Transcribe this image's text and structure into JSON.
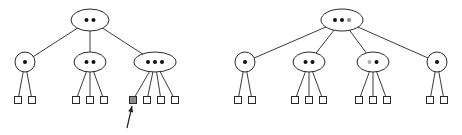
{
  "diagram": {
    "type": "2-3-4 tree insertion (before / after split)",
    "colors": {
      "stroke": "#2a2a2a",
      "key": "#111111",
      "highlight_key": "#8a8a8a",
      "promoted_key_light": "#b0b0b0",
      "shaded_leaf": "#8a8a8a"
    },
    "trees": [
      {
        "name": "before",
        "root": {
          "cx": 90,
          "cy": 20,
          "rx": 19,
          "ry": 11,
          "keys": 2
        },
        "children": [
          {
            "cx": 25,
            "cy": 62,
            "rx": 10,
            "ry": 10,
            "keys": 1,
            "leaves": [
              18,
              32
            ]
          },
          {
            "cx": 90,
            "cy": 62,
            "rx": 16,
            "ry": 10,
            "keys": 2,
            "leaves": [
              76,
              90,
              104
            ]
          },
          {
            "cx": 155,
            "cy": 62,
            "rx": 21,
            "ry": 10,
            "keys": 3,
            "leaves": [
              133,
              147,
              161,
              175
            ],
            "shaded_leaf_index": 0
          }
        ],
        "leaf_y": 100,
        "arrow": {
          "from": [
            127,
            128
          ],
          "to": [
            132,
            106
          ],
          "label": "insertion point"
        }
      },
      {
        "name": "after",
        "root": {
          "cx": 342,
          "cy": 20,
          "rx": 21,
          "ry": 11,
          "keys": 3,
          "highlight_key_index": 2
        },
        "children": [
          {
            "cx": 245,
            "cy": 62,
            "rx": 10,
            "ry": 10,
            "keys": 1,
            "leaves": [
              238,
              252
            ]
          },
          {
            "cx": 309,
            "cy": 62,
            "rx": 16,
            "ry": 10,
            "keys": 2,
            "leaves": [
              295,
              309,
              323
            ]
          },
          {
            "cx": 373,
            "cy": 62,
            "rx": 16,
            "ry": 10,
            "keys": 2,
            "light_key_index": 0,
            "leaves": [
              359,
              373,
              387
            ]
          },
          {
            "cx": 437,
            "cy": 62,
            "rx": 10,
            "ry": 10,
            "keys": 1,
            "leaves": [
              430,
              444
            ]
          }
        ],
        "leaf_y": 100
      }
    ]
  }
}
